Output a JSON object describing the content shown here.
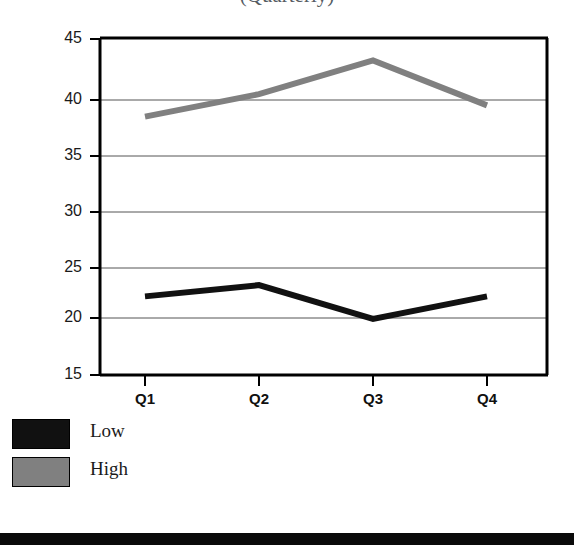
{
  "title": {
    "text": "(Quarterly)"
  },
  "chart_data": {
    "type": "line",
    "title": "",
    "xlabel": "",
    "ylabel": "",
    "categories": [
      "Q1",
      "Q2",
      "Q3",
      "Q4"
    ],
    "series": [
      {
        "name": "Low",
        "color": "#111111",
        "values": [
          22,
          23,
          20,
          22
        ]
      },
      {
        "name": "High",
        "color": "#808080",
        "values": [
          38,
          40,
          43,
          39
        ]
      }
    ],
    "ylim": [
      15,
      45
    ],
    "yticks": [
      45,
      40,
      35,
      30,
      25,
      20,
      15
    ],
    "grid": true,
    "grid_axis": "y",
    "legend_position": "below-left",
    "legend": [
      "Low",
      "High"
    ]
  },
  "axis": {
    "y_tick_labels": [
      "45",
      "40",
      "35",
      "30",
      "25",
      "20",
      "15"
    ],
    "x_tick_labels": [
      "Q1",
      "Q2",
      "Q3",
      "Q4"
    ]
  },
  "legend": {
    "items": [
      {
        "label": "Low",
        "color": "#111111"
      },
      {
        "label": "High",
        "color": "#808080"
      }
    ]
  },
  "colors": {
    "low_series": "#111111",
    "high_series": "#808080",
    "axis": "#000000",
    "gridline": "#555555",
    "background": "#ffffff"
  }
}
